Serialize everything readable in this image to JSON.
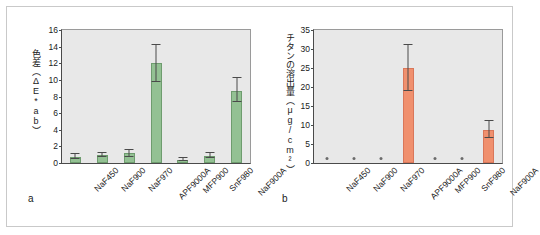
{
  "figure": {
    "background_color": "#ffffff",
    "border_color": "#c9c9c9",
    "plot_background": "#e8e8e8"
  },
  "panels": [
    {
      "panel_label": "a",
      "accent_color": "#93c193",
      "y_axis_label": "色差（ΔE*ab）",
      "y_ticks": [
        "0",
        "2",
        "4",
        "6",
        "8",
        "10",
        "12",
        "14",
        "16"
      ]
    },
    {
      "panel_label": "b",
      "accent_color": "#f0906e",
      "y_axis_label": "チタンの溶出量（μg/cm²）",
      "y_ticks": [
        "0",
        "5",
        "10",
        "15",
        "20",
        "25",
        "30",
        "35"
      ]
    }
  ],
  "chart_data": [
    {
      "type": "bar",
      "title": "",
      "panel": "a",
      "xlabel": "",
      "ylabel": "色差（ΔE*ab）",
      "ylim": [
        0,
        16
      ],
      "ytick_step": 2,
      "grid": false,
      "legend": "none",
      "bar_color": "#93c193",
      "categories": [
        "NaF450",
        "NaF900",
        "NaF970",
        "APF9000A",
        "MFP900",
        "SnF980",
        "NaF900A"
      ],
      "values": [
        0.75,
        0.95,
        1.15,
        12.0,
        0.4,
        0.9,
        8.7
      ],
      "error_low": [
        0.45,
        0.75,
        0.75,
        9.7,
        0.25,
        0.6,
        7.4
      ],
      "error_high": [
        1.1,
        1.15,
        1.6,
        14.2,
        0.6,
        1.25,
        10.2
      ]
    },
    {
      "type": "bar",
      "title": "",
      "panel": "b",
      "xlabel": "",
      "ylabel": "チタンの溶出量（μg/cm²）",
      "ylim": [
        0,
        35
      ],
      "ytick_step": 5,
      "grid": false,
      "legend": "none",
      "bar_color": "#f0906e",
      "categories": [
        "NaF450",
        "NaF900",
        "NaF970",
        "APF9000A",
        "MFP900",
        "SnF980",
        "NaF900A"
      ],
      "values": [
        0,
        0,
        0,
        25.0,
        0,
        0,
        8.7
      ],
      "error_low": [
        0,
        0,
        0,
        19.0,
        0,
        0,
        6.5
      ],
      "error_high": [
        0,
        0,
        0,
        31.0,
        0,
        0,
        11.0
      ],
      "zero_marker": "dot"
    }
  ]
}
